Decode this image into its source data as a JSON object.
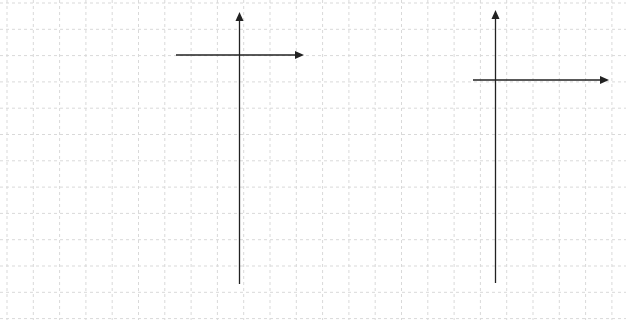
{
  "canvas": {
    "width": 626,
    "height": 320,
    "background": "#ffffff"
  },
  "grid": {
    "color": "#d9d9d9",
    "dash": "3,3",
    "spacing": 26.3,
    "offset_x": 7,
    "offset_y": 3
  },
  "axes_style": {
    "stroke": "#222222",
    "width": 1.3,
    "arrow_size": 7
  },
  "axes": [
    {
      "name": "left-axes",
      "vertical": {
        "x": 239.5,
        "y_top": 12,
        "y_bottom": 284
      },
      "horizontal": {
        "y": 55,
        "x_left": 176,
        "x_right": 304
      }
    },
    {
      "name": "right-axes",
      "vertical": {
        "x": 495.5,
        "y_top": 10,
        "y_bottom": 283
      },
      "horizontal": {
        "y": 80,
        "x_left": 473,
        "x_right": 609
      }
    }
  ]
}
